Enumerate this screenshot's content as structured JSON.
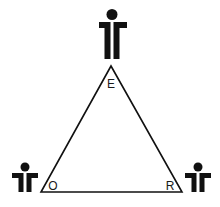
{
  "diagram": {
    "type": "triangle-relationship",
    "colors": {
      "ink": "#111111",
      "background": "#ffffff"
    },
    "vertices": [
      {
        "id": "top",
        "label": "E",
        "figure_icon": "person-icon"
      },
      {
        "id": "bottom-left",
        "label": "O",
        "figure_icon": "person-icon"
      },
      {
        "id": "bottom-right",
        "label": "R",
        "figure_icon": "person-icon"
      }
    ]
  }
}
